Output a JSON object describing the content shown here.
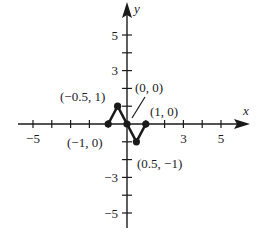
{
  "chart_data": {
    "type": "line",
    "title": "",
    "xlabel": "x",
    "ylabel": "y",
    "xlim": [
      -6,
      6
    ],
    "ylim": [
      -6,
      6
    ],
    "grid": false,
    "x_ticks": [
      -5,
      -4,
      -3,
      -2,
      -1,
      0,
      1,
      2,
      3,
      4,
      5
    ],
    "y_ticks": [
      -5,
      -4,
      -3,
      -2,
      -1,
      0,
      1,
      2,
      3,
      4,
      5
    ],
    "x_tick_labels": [
      {
        "value": -5,
        "label": "−5"
      },
      {
        "value": 3,
        "label": "3"
      },
      {
        "value": 5,
        "label": "5"
      }
    ],
    "y_tick_labels": [
      {
        "value": 5,
        "label": "5"
      },
      {
        "value": 3,
        "label": "3"
      },
      {
        "value": -3,
        "label": "−3"
      },
      {
        "value": -5,
        "label": "−5"
      }
    ],
    "series": [
      {
        "name": "piecewise linear",
        "points": [
          {
            "x": -1,
            "y": 0,
            "label": "(−1, 0)"
          },
          {
            "x": -0.5,
            "y": 1,
            "label": "(−0.5, 1)"
          },
          {
            "x": 0,
            "y": 0,
            "label": "(0, 0)"
          },
          {
            "x": 0.5,
            "y": -1,
            "label": "(0.5, −1)"
          },
          {
            "x": 1,
            "y": 0,
            "label": "(1, 0)"
          }
        ]
      }
    ]
  },
  "colors": {
    "ink": "#1a1a1a",
    "background": "#ffffff"
  }
}
